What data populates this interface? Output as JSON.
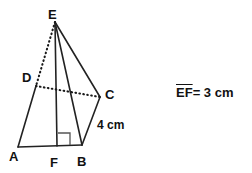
{
  "figure": {
    "background_color": "#ffffff",
    "stroke_color": "#222222",
    "label_color": "#111111",
    "vertices": [
      {
        "name": "E",
        "label": "E",
        "x": 55,
        "y": 22,
        "label_x": 48,
        "label_y": 8
      },
      {
        "name": "D",
        "label": "D",
        "x": 36,
        "y": 86,
        "label_x": 22,
        "label_y": 71
      },
      {
        "name": "C",
        "label": "C",
        "x": 100,
        "y": 97,
        "label_x": 105,
        "label_y": 88
      },
      {
        "name": "A",
        "label": "A",
        "x": 18,
        "y": 147,
        "label_x": 9,
        "label_y": 150
      },
      {
        "name": "F",
        "label": "F",
        "x": 57,
        "y": 146,
        "label_x": 50,
        "label_y": 156
      },
      {
        "name": "B",
        "label": "B",
        "x": 82,
        "y": 145,
        "label_x": 77,
        "label_y": 155
      }
    ],
    "solid_edges": [
      {
        "name": "edge-A-D",
        "from": "A",
        "to": "D"
      },
      {
        "name": "edge-A-B",
        "from": "A",
        "to": "B"
      },
      {
        "name": "edge-B-C",
        "from": "B",
        "to": "C"
      },
      {
        "name": "edge-C-E",
        "from": "C",
        "to": "E"
      },
      {
        "name": "edge-E-B",
        "from": "E",
        "to": "B"
      },
      {
        "name": "edge-E-F",
        "from": "E",
        "to": "F"
      }
    ],
    "dotted_edges": [
      {
        "name": "edge-E-D",
        "from": "E",
        "to": "D"
      },
      {
        "name": "edge-D-C",
        "from": "D",
        "to": "C"
      }
    ],
    "right_angle": {
      "name": "right-angle-at-F",
      "at": "F",
      "points": "58,133 70,133 70,145"
    },
    "dimension_labels": [
      {
        "name": "edge-length-bc",
        "text": "4 cm",
        "x": 97,
        "y": 119
      }
    ]
  },
  "note": {
    "segment": "EF",
    "equals": "= 3 cm",
    "full_text": "EF = 3 cm"
  }
}
